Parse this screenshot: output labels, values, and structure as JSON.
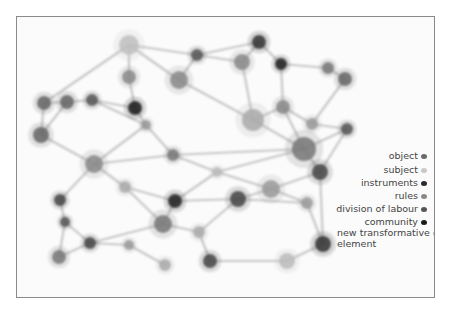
{
  "diagram": {
    "legend": [
      {
        "label": "object",
        "color": "#6a6a6a",
        "top": 0,
        "right": 5
      },
      {
        "label": "subject",
        "color": "#c8c8c8",
        "top": 14
      },
      {
        "label": "instruments",
        "color": "#2a2a2a",
        "top": 27
      },
      {
        "label": "rules",
        "color": "#8a8a8a",
        "top": 40
      },
      {
        "label": "division of labour",
        "color": "#555555",
        "top": 53
      },
      {
        "label": "community",
        "color": "#1a1a1a",
        "top": 66
      },
      {
        "label": "new transformative element",
        "color": "#b0b0b0",
        "top": 77
      }
    ],
    "nodes": [
      {
        "x": 112,
        "y": 28,
        "r": 10,
        "color": "#c0c0c0"
      },
      {
        "x": 180,
        "y": 38,
        "r": 6,
        "color": "#555"
      },
      {
        "x": 242,
        "y": 25,
        "r": 7,
        "color": "#333"
      },
      {
        "x": 264,
        "y": 47,
        "r": 6,
        "color": "#222"
      },
      {
        "x": 311,
        "y": 51,
        "r": 6,
        "color": "#777"
      },
      {
        "x": 328,
        "y": 62,
        "r": 7,
        "color": "#666"
      },
      {
        "x": 112,
        "y": 60,
        "r": 7,
        "color": "#888"
      },
      {
        "x": 162,
        "y": 63,
        "r": 9,
        "color": "#888"
      },
      {
        "x": 27,
        "y": 86,
        "r": 7,
        "color": "#666"
      },
      {
        "x": 50,
        "y": 85,
        "r": 7,
        "color": "#666"
      },
      {
        "x": 75,
        "y": 83,
        "r": 6,
        "color": "#555"
      },
      {
        "x": 118,
        "y": 91,
        "r": 7,
        "color": "#1a1a1a"
      },
      {
        "x": 225,
        "y": 45,
        "r": 8,
        "color": "#888"
      },
      {
        "x": 266,
        "y": 90,
        "r": 7,
        "color": "#888"
      },
      {
        "x": 295,
        "y": 107,
        "r": 6,
        "color": "#999"
      },
      {
        "x": 24,
        "y": 118,
        "r": 8,
        "color": "#666"
      },
      {
        "x": 129,
        "y": 108,
        "r": 5,
        "color": "#999"
      },
      {
        "x": 236,
        "y": 103,
        "r": 11,
        "color": "#aaa"
      },
      {
        "x": 287,
        "y": 132,
        "r": 12,
        "color": "#777"
      },
      {
        "x": 330,
        "y": 112,
        "r": 6,
        "color": "#555"
      },
      {
        "x": 77,
        "y": 147,
        "r": 9,
        "color": "#888"
      },
      {
        "x": 156,
        "y": 138,
        "r": 6,
        "color": "#777"
      },
      {
        "x": 200,
        "y": 155,
        "r": 5,
        "color": "#bbb"
      },
      {
        "x": 303,
        "y": 155,
        "r": 8,
        "color": "#444"
      },
      {
        "x": 43,
        "y": 183,
        "r": 6,
        "color": "#444"
      },
      {
        "x": 108,
        "y": 170,
        "r": 6,
        "color": "#aaa"
      },
      {
        "x": 158,
        "y": 184,
        "r": 7,
        "color": "#222"
      },
      {
        "x": 221,
        "y": 182,
        "r": 8,
        "color": "#444"
      },
      {
        "x": 254,
        "y": 172,
        "r": 9,
        "color": "#999"
      },
      {
        "x": 48,
        "y": 205,
        "r": 5,
        "color": "#555"
      },
      {
        "x": 146,
        "y": 207,
        "r": 9,
        "color": "#777"
      },
      {
        "x": 182,
        "y": 215,
        "r": 6,
        "color": "#aaa"
      },
      {
        "x": 290,
        "y": 186,
        "r": 6,
        "color": "#999"
      },
      {
        "x": 73,
        "y": 226,
        "r": 6,
        "color": "#444"
      },
      {
        "x": 112,
        "y": 228,
        "r": 5,
        "color": "#999"
      },
      {
        "x": 193,
        "y": 244,
        "r": 7,
        "color": "#444"
      },
      {
        "x": 306,
        "y": 227,
        "r": 8,
        "color": "#333"
      },
      {
        "x": 42,
        "y": 240,
        "r": 7,
        "color": "#777"
      },
      {
        "x": 148,
        "y": 248,
        "r": 6,
        "color": "#aaa"
      },
      {
        "x": 270,
        "y": 244,
        "r": 8,
        "color": "#bbb"
      }
    ],
    "edges": [
      [
        0,
        1
      ],
      [
        1,
        2
      ],
      [
        2,
        3
      ],
      [
        3,
        4
      ],
      [
        4,
        5
      ],
      [
        0,
        6
      ],
      [
        0,
        8
      ],
      [
        0,
        7
      ],
      [
        1,
        12
      ],
      [
        12,
        2
      ],
      [
        1,
        7
      ],
      [
        6,
        11
      ],
      [
        8,
        9
      ],
      [
        9,
        10
      ],
      [
        10,
        11
      ],
      [
        8,
        15
      ],
      [
        9,
        15
      ],
      [
        11,
        16
      ],
      [
        7,
        17
      ],
      [
        12,
        17
      ],
      [
        3,
        13
      ],
      [
        13,
        17
      ],
      [
        13,
        14
      ],
      [
        5,
        14
      ],
      [
        14,
        19
      ],
      [
        17,
        18
      ],
      [
        18,
        19
      ],
      [
        18,
        13
      ],
      [
        15,
        20
      ],
      [
        16,
        21
      ],
      [
        21,
        18
      ],
      [
        20,
        21
      ],
      [
        21,
        22
      ],
      [
        22,
        18
      ],
      [
        18,
        23
      ],
      [
        23,
        19
      ],
      [
        20,
        24
      ],
      [
        20,
        25
      ],
      [
        25,
        26
      ],
      [
        26,
        27
      ],
      [
        27,
        28
      ],
      [
        28,
        23
      ],
      [
        24,
        29
      ],
      [
        29,
        33
      ],
      [
        30,
        26
      ],
      [
        30,
        33
      ],
      [
        30,
        31
      ],
      [
        31,
        27
      ],
      [
        28,
        32
      ],
      [
        32,
        36
      ],
      [
        33,
        37
      ],
      [
        33,
        34
      ],
      [
        34,
        38
      ],
      [
        35,
        31
      ],
      [
        35,
        39
      ],
      [
        36,
        39
      ],
      [
        36,
        23
      ],
      [
        27,
        32
      ],
      [
        10,
        16
      ],
      [
        16,
        20
      ],
      [
        22,
        28
      ],
      [
        37,
        29
      ],
      [
        25,
        30
      ],
      [
        22,
        26
      ]
    ]
  }
}
